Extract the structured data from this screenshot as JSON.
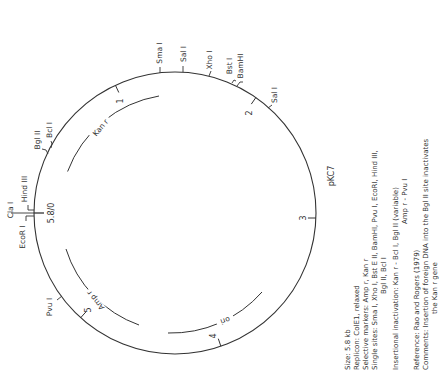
{
  "plasmid": {
    "name": "pKC7",
    "size_kb": 5.8,
    "origin_label": "5.8/0"
  },
  "scale_ticks": [
    {
      "label": "1",
      "kb": 1
    },
    {
      "label": "2",
      "kb": 2
    },
    {
      "label": "3",
      "kb": 3
    },
    {
      "label": "4",
      "kb": 4
    },
    {
      "label": "5",
      "kb": 5
    }
  ],
  "restriction_sites": [
    {
      "label": "EcoR I",
      "angle": 176
    },
    {
      "label": "Cla I",
      "angle": 180
    },
    {
      "label": "Hind III",
      "angle": 183
    },
    {
      "label": "Bgl II",
      "angle": 208
    },
    {
      "label": "Bcl I",
      "angle": 212
    },
    {
      "label": "Sma I",
      "angle": 264
    },
    {
      "label": "Sal I",
      "angle": 274
    },
    {
      "label": "Xho I",
      "angle": 287
    },
    {
      "label": "Bst I",
      "angle": 296
    },
    {
      "label": "BamHI",
      "angle": 300
    },
    {
      "label": "Sal I",
      "angle": 313
    },
    {
      "label": "Pvu I",
      "angle": 143
    }
  ],
  "genes": [
    {
      "label": "Kan r",
      "start_angle": 200,
      "end_angle": 270
    },
    {
      "label": "Amp r",
      "start_angle": 110,
      "end_angle": 160
    },
    {
      "label": "ori",
      "start_angle": 55,
      "end_angle": 100
    }
  ],
  "info": {
    "size": "Size: 5.8 kb",
    "replicon": "Replicon: ColE1, relaxed",
    "markers": "Selective markers: Amp r, Kan r",
    "single_sites_1": "Single sites: Sma I, Xho I, Bst E II, BamHI, Pvu I, EcoRI, Hind III,",
    "single_sites_2": "Bgl II, Bcl I",
    "insertional_1": "Insertional inactivation: Kan r - Bcl I, Bgl II (variable)",
    "insertional_2": "Amp r - Pvu I",
    "reference": "Reference: Rao and Rogers (1979)",
    "comments_1": "Comments: Insertion of foreign DNA into the Bgl II site inactivates",
    "comments_2": "the Kan r gene"
  },
  "colors": {
    "line": "#333333",
    "background": "#ffffff"
  }
}
